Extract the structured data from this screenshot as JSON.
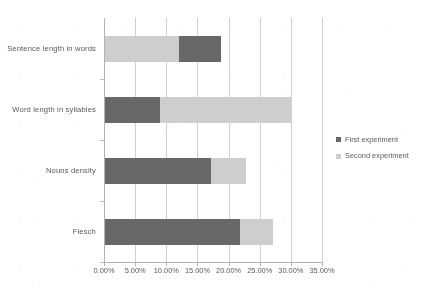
{
  "chart_data": {
    "type": "bar",
    "orientation": "horizontal",
    "stacked": true,
    "title": "",
    "subtitle": "",
    "xlabel": "",
    "ylabel": "",
    "xlim": [
      0,
      35
    ],
    "xticks": [
      0,
      5,
      10,
      15,
      20,
      25,
      30,
      35
    ],
    "xtick_labels": [
      "0.00%",
      "5.00%",
      "10.00%",
      "15.00%",
      "20.00%",
      "25.00%",
      "30.00%",
      "35.00%"
    ],
    "grid": "vertical",
    "legend_position": "right",
    "categories": [
      "Sentence length in words",
      "Word length in syllables",
      "Nouns density",
      "Flesch"
    ],
    "series": [
      {
        "name": "First experiment",
        "color": "#646464",
        "values": [
          6.8,
          9.0,
          17.2,
          21.8
        ]
      },
      {
        "name": "Second experiment",
        "color": "#d0d0d0",
        "values": [
          12.0,
          21.0,
          5.6,
          5.3
        ]
      }
    ],
    "stack_order": [
      [
        "Second experiment",
        "First experiment"
      ],
      [
        "First experiment",
        "Second experiment"
      ],
      [
        "First experiment",
        "Second experiment"
      ],
      [
        "First experiment",
        "Second experiment"
      ]
    ],
    "totals": [
      18.8,
      30.0,
      22.8,
      27.1
    ],
    "axis_color": "#b4b4b4",
    "grid_color": "#d4d4d4",
    "text_color": "#555555",
    "background": "#ffffff"
  },
  "legend": {
    "items": [
      {
        "label": "First experiment",
        "color": "#646464"
      },
      {
        "label": "Second experiment",
        "color": "#d0d0d0"
      }
    ]
  }
}
